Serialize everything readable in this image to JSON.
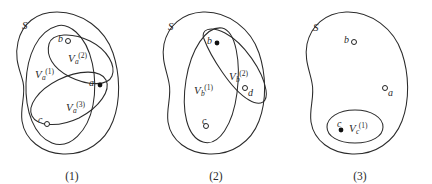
{
  "figure": {
    "background_color": "#ffffff",
    "stroke_color": "#2b2b2b",
    "text_color": "#2a2a2a"
  },
  "panels": [
    {
      "id": "panel-1",
      "caption": "(1)",
      "universe_label": "S",
      "regions": [
        {
          "name": "V_a_1",
          "base": "V",
          "sub": "a",
          "sup": "(1)"
        },
        {
          "name": "V_a_2",
          "base": "V",
          "sub": "a",
          "sup": "(2)"
        },
        {
          "name": "V_a_3",
          "base": "V",
          "sub": "a",
          "sup": "(3)"
        }
      ],
      "points": [
        {
          "label": "b",
          "marker": "open"
        },
        {
          "label": "a",
          "marker": "filled"
        },
        {
          "label": "c",
          "marker": "open"
        }
      ]
    },
    {
      "id": "panel-2",
      "caption": "(2)",
      "universe_label": "S",
      "regions": [
        {
          "name": "V_b_1",
          "base": "V",
          "sub": "b",
          "sup": "(1)"
        },
        {
          "name": "V_b_2",
          "base": "V",
          "sub": "b",
          "sup": "(2)"
        }
      ],
      "points": [
        {
          "label": "b",
          "marker": "filled"
        },
        {
          "label": "d",
          "marker": "open"
        },
        {
          "label": "c",
          "marker": "open"
        }
      ]
    },
    {
      "id": "panel-3",
      "caption": "(3)",
      "universe_label": "S",
      "regions": [
        {
          "name": "V_c_1",
          "base": "V",
          "sub": "c",
          "sup": "(1)"
        }
      ],
      "points": [
        {
          "label": "b",
          "marker": "open"
        },
        {
          "label": "a",
          "marker": "open"
        },
        {
          "label": "c",
          "marker": "filled"
        }
      ]
    }
  ]
}
